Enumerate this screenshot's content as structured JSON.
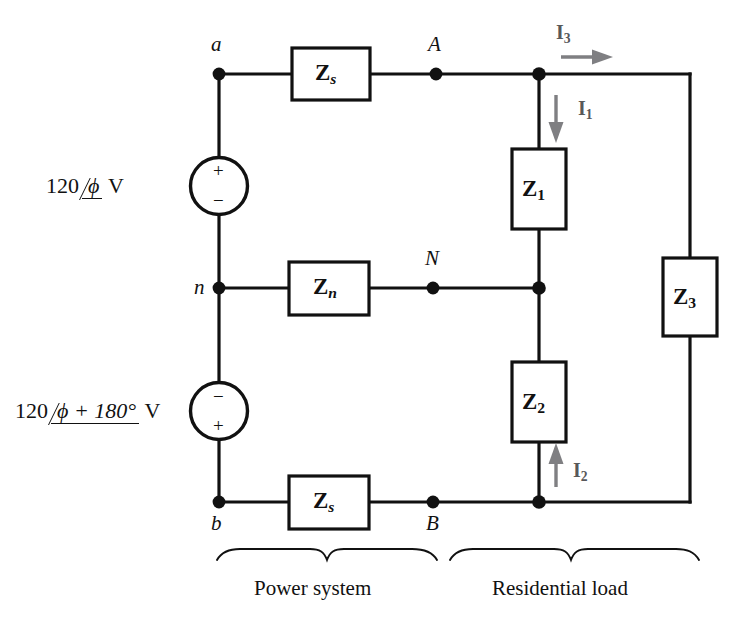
{
  "figure": {
    "type": "circuit-schematic"
  },
  "sources": [
    {
      "id": "source-top",
      "magnitude": "120",
      "angle": "ϕ",
      "unit": "V",
      "label_full": "120 ∠ϕ V",
      "terminal_top": "+",
      "terminal_bottom": "−"
    },
    {
      "id": "source-bottom",
      "magnitude": "120",
      "angle": "ϕ + 180°",
      "unit": "V",
      "label_full": "120 ∠ϕ + 180° V",
      "terminal_top": "−",
      "terminal_bottom": "+"
    }
  ],
  "nodes": [
    {
      "id": "node-a",
      "label": "a"
    },
    {
      "id": "node-n",
      "label": "n"
    },
    {
      "id": "node-b",
      "label": "b"
    },
    {
      "id": "node-A",
      "label": "A"
    },
    {
      "id": "node-N",
      "label": "N"
    },
    {
      "id": "node-B",
      "label": "B"
    }
  ],
  "impedances": [
    {
      "id": "impedance-zs-top",
      "symbol": "Z",
      "subscript": "s",
      "sub_italic": true
    },
    {
      "id": "impedance-zn",
      "symbol": "Z",
      "subscript": "n",
      "sub_italic": true
    },
    {
      "id": "impedance-zs-bottom",
      "symbol": "Z",
      "subscript": "s",
      "sub_italic": true
    },
    {
      "id": "impedance-z1",
      "symbol": "Z",
      "subscript": "1",
      "sub_italic": false
    },
    {
      "id": "impedance-z2",
      "symbol": "Z",
      "subscript": "2",
      "sub_italic": false
    },
    {
      "id": "impedance-z3",
      "symbol": "Z",
      "subscript": "3",
      "sub_italic": false
    }
  ],
  "currents": [
    {
      "id": "current-i1",
      "symbol": "I",
      "subscript": "1",
      "direction": "down"
    },
    {
      "id": "current-i2",
      "symbol": "I",
      "subscript": "2",
      "direction": "up"
    },
    {
      "id": "current-i3",
      "symbol": "I",
      "subscript": "3",
      "direction": "right"
    }
  ],
  "sections": [
    {
      "id": "section-power-system",
      "label": "Power system"
    },
    {
      "id": "section-residential-load",
      "label": "Residential load"
    }
  ],
  "colors": {
    "wire": "#111111",
    "text": "#111111",
    "current_arrow": "#7f7f82",
    "current_label": "#58585a",
    "background": "#ffffff"
  }
}
